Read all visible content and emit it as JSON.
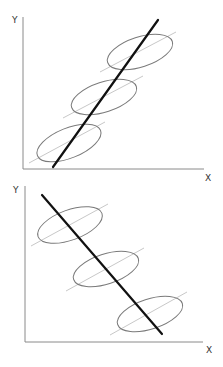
{
  "panels": [
    {
      "id": "top",
      "relationship": "positive",
      "x_label": "X",
      "y_label": "Y",
      "groups": 3,
      "description": "Overall trend line slopes upward across three within-group ellipses with positive within-group slopes"
    },
    {
      "id": "bottom",
      "relationship": "negative",
      "x_label": "X",
      "y_label": "Y",
      "groups": 3,
      "description": "Overall trend line slopes downward across three within-group ellipses with positive within-group slopes"
    }
  ],
  "colors": {
    "axis": "#8a8a8a",
    "trend_line": "#111111",
    "ellipse": "#7a7a7a",
    "within_group_line": "#c8c8c8"
  }
}
